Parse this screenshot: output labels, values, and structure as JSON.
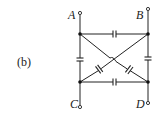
{
  "figure": {
    "label": "(b)"
  },
  "terminals": [
    {
      "name": "A",
      "x": 80,
      "y": 13
    },
    {
      "name": "B",
      "x": 148,
      "y": 9
    },
    {
      "name": "C",
      "x": 80,
      "y": 107
    },
    {
      "name": "D",
      "x": 148,
      "y": 103
    }
  ],
  "nodes": [
    {
      "id": "top-left",
      "x": 80,
      "y": 34
    },
    {
      "id": "top-right",
      "x": 148,
      "y": 34
    },
    {
      "id": "bottom-left",
      "x": 80,
      "y": 82
    },
    {
      "id": "bottom-right",
      "x": 148,
      "y": 82
    }
  ],
  "capacitors": [
    {
      "id": "top",
      "from": "top-left",
      "to": "top-right"
    },
    {
      "id": "bottom",
      "from": "bottom-left",
      "to": "bottom-right"
    },
    {
      "id": "left",
      "from": "top-left",
      "to": "bottom-left"
    },
    {
      "id": "right",
      "from": "top-right",
      "to": "bottom-right"
    },
    {
      "id": "diag-tl-br",
      "from": "top-left",
      "to": "bottom-right"
    },
    {
      "id": "diag-tr-bl",
      "from": "top-right",
      "to": "bottom-left"
    }
  ],
  "colors": {
    "line": "#222222",
    "background": "#ffffff"
  }
}
